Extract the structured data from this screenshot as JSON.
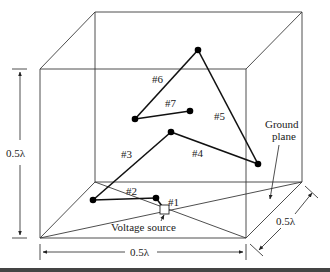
{
  "figure": {
    "type": "3D wire antenna over ground plane in a cubic domain",
    "wire_labels": [
      "#1",
      "#2",
      "#3",
      "#4",
      "#5",
      "#6",
      "#7"
    ],
    "annotations": {
      "voltage_source": "Voltage source",
      "ground_plane_line1": "Ground",
      "ground_plane_line2": "plane"
    },
    "dimensions": {
      "height": "0.5λ",
      "width": "0.5λ",
      "depth": "0.5λ"
    },
    "colors": {
      "line": "#3a3a3a",
      "wire": "#111111",
      "background": "#ffffff"
    }
  }
}
